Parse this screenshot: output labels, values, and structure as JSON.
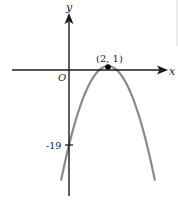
{
  "chart_data": {
    "type": "line",
    "title": "",
    "function": "y = -5(x - 2)^2 + 1",
    "xlabel": "x",
    "ylabel": "y",
    "origin_label": "O",
    "series": [
      {
        "name": "parabola",
        "color": "#8a8a8a",
        "points": [
          {
            "x": -0.4,
            "y": -27.8
          },
          {
            "x": 0,
            "y": -19
          },
          {
            "x": 0.5,
            "y": -10.25
          },
          {
            "x": 1,
            "y": -4
          },
          {
            "x": 1.5,
            "y": -0.25
          },
          {
            "x": 2,
            "y": 1
          },
          {
            "x": 2.5,
            "y": -0.25
          },
          {
            "x": 3,
            "y": -4
          },
          {
            "x": 3.5,
            "y": -10.25
          },
          {
            "x": 4,
            "y": -19
          },
          {
            "x": 4.4,
            "y": -27.8
          }
        ]
      }
    ],
    "annotations": [
      {
        "type": "point",
        "x": 2,
        "y": 1,
        "label": "(2, 1)"
      },
      {
        "type": "y-tick",
        "y": -19,
        "label": "-19"
      }
    ],
    "xlim": [
      -2.9,
      4.8
    ],
    "ylim": [
      -31,
      14
    ],
    "grid": false,
    "legend": "none"
  },
  "labels": {
    "x_axis": "x",
    "y_axis": "y",
    "origin": "O",
    "vertex": "(2, 1)",
    "y_intercept": "-19"
  },
  "colors": {
    "axis": "#1a1a1a",
    "curve": "#8a8a8a",
    "point": "#000000",
    "edge_line": "#d9d9d9"
  }
}
